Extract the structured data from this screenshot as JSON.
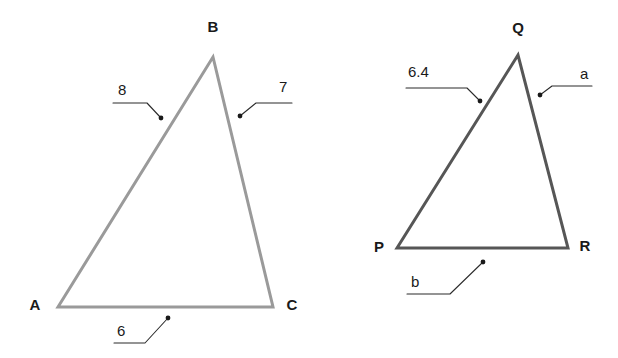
{
  "figure": {
    "background_color": "#ffffff",
    "triangles": [
      {
        "id": "triangle-abc",
        "name": "Triangle ABC",
        "stroke_color": "#9a9a9a",
        "stroke_width": 3,
        "vertices": [
          {
            "name": "A",
            "label": "A",
            "x": 58,
            "y": 307,
            "label_x": 35,
            "label_y": 310
          },
          {
            "name": "B",
            "label": "B",
            "x": 213,
            "y": 57,
            "label_x": 213,
            "label_y": 32
          },
          {
            "name": "C",
            "label": "C",
            "x": 273,
            "y": 307,
            "label_x": 292,
            "label_y": 310
          }
        ],
        "sides": [
          {
            "name": "side-ab",
            "label": "8",
            "label_x": 118,
            "label_y": 95,
            "leader": {
              "x1": 113,
              "y1": 103,
              "x2": 147,
              "y2": 103,
              "x3": 161,
              "y3": 118
            },
            "dot": {
              "x": 161,
              "y": 118
            }
          },
          {
            "name": "side-bc",
            "label": "7",
            "label_x": 279,
            "label_y": 92,
            "leader": {
              "x1": 292,
              "y1": 103,
              "x2": 256,
              "y2": 103,
              "x3": 240,
              "y3": 116
            },
            "dot": {
              "x": 240,
              "y": 116
            }
          },
          {
            "name": "side-ac",
            "label": "6",
            "label_x": 117,
            "label_y": 336,
            "leader": {
              "x1": 114,
              "y1": 343,
              "x2": 145,
              "y2": 343,
              "x3": 168,
              "y3": 318
            },
            "dot": {
              "x": 168,
              "y": 318
            }
          }
        ]
      },
      {
        "id": "triangle-pqr",
        "name": "Triangle PQR",
        "stroke_color": "#565656",
        "stroke_width": 3,
        "vertices": [
          {
            "name": "P",
            "label": "P",
            "x": 397,
            "y": 248,
            "label_x": 379,
            "label_y": 252
          },
          {
            "name": "Q",
            "label": "Q",
            "x": 518,
            "y": 55,
            "label_x": 518,
            "label_y": 33
          },
          {
            "name": "R",
            "label": "R",
            "x": 568,
            "y": 248,
            "label_x": 585,
            "label_y": 251
          }
        ],
        "sides": [
          {
            "name": "side-pq",
            "label": "6.4",
            "label_x": 408,
            "label_y": 77,
            "leader": {
              "x1": 406,
              "y1": 88,
              "x2": 467,
              "y2": 88,
              "x3": 480,
              "y3": 101
            },
            "dot": {
              "x": 480,
              "y": 101
            }
          },
          {
            "name": "side-qr",
            "label": "a",
            "label_x": 580,
            "label_y": 79,
            "leader": {
              "x1": 592,
              "y1": 86,
              "x2": 552,
              "y2": 86,
              "x3": 540,
              "y3": 95
            },
            "dot": {
              "x": 540,
              "y": 95
            }
          },
          {
            "name": "side-pr",
            "label": "b",
            "label_x": 411,
            "label_y": 287,
            "leader": {
              "x1": 407,
              "y1": 294,
              "x2": 450,
              "y2": 294,
              "x3": 483,
              "y3": 262
            },
            "dot": {
              "x": 483,
              "y": 262
            }
          }
        ]
      }
    ]
  }
}
